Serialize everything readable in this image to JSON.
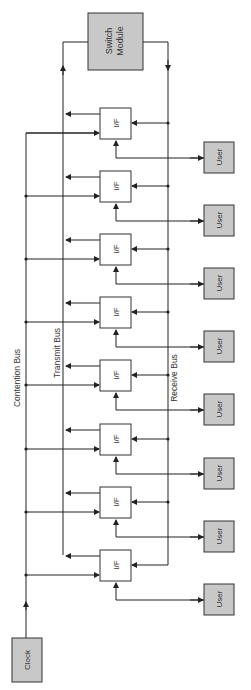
{
  "diagram": {
    "switch_module": {
      "label_line1": "Switch",
      "label_line2": "Module"
    },
    "clock": {
      "label": "Clock"
    },
    "buses": {
      "contention": "Contention Bus",
      "transmit": "Transmit Bus",
      "receive": "Receive Bus"
    },
    "interface_label": "I/F",
    "user_label": "User",
    "interface_count": 8,
    "colors": {
      "box_fill": "#c8c8c8",
      "line": "#222222",
      "white_box": "#ffffff"
    }
  }
}
